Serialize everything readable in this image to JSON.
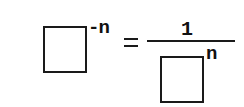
{
  "equation": {
    "description": "Negative exponent rule",
    "left": {
      "base": "square-placeholder",
      "exponent": "-n"
    },
    "operator": "=",
    "right": {
      "numerator": "1",
      "denominator": {
        "base": "square-placeholder",
        "exponent": "n"
      }
    }
  },
  "colors": {
    "stroke": "#1a1a1a",
    "background": "#ffffff"
  }
}
